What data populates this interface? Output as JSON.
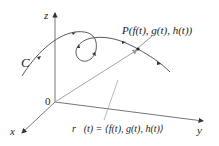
{
  "diagram": {
    "axes": {
      "z_label": "z",
      "y_label": "y",
      "x_label": "x",
      "origin_label": "0"
    },
    "curve_label": "C",
    "point_label": "P(f(t), g(t), h(t))",
    "vector_label": "r⃗(t) = ⟨f(t), g(t), h(t)⟩",
    "colors": {
      "axis": "#555555",
      "curve": "#444444",
      "vector": "#999999",
      "text": "#222222"
    }
  }
}
